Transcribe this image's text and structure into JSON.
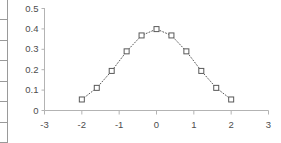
{
  "spreadsheet_strip": {
    "name": "cropped-spreadsheet-column",
    "visible_cell_count": 7,
    "cells": [
      "",
      "",
      "",
      "",
      "",
      "",
      ""
    ]
  },
  "chart_data": {
    "type": "scatter",
    "title": "",
    "subtitle": "",
    "xlabel": "",
    "ylabel": "",
    "xlim": [
      -3,
      3
    ],
    "ylim": [
      0,
      0.5
    ],
    "grid": false,
    "legend": false,
    "legend_position": "none",
    "marker": "square-open",
    "marker_color": "#595959",
    "line_style": "dotted",
    "line_color": "#595959",
    "axis_color": "#b3b3b3",
    "tick_label_color": "#4d4d4d",
    "series": [
      {
        "name": "Normal PDF",
        "x": [
          -2,
          -1.6,
          -1.2,
          -0.8,
          -0.4,
          0,
          0.4,
          0.8,
          1.2,
          1.6,
          2
        ],
        "values": [
          0.054,
          0.111,
          0.194,
          0.29,
          0.368,
          0.399,
          0.368,
          0.29,
          0.194,
          0.111,
          0.054
        ]
      }
    ],
    "x_ticks": [
      -3,
      -2,
      -1,
      0,
      1,
      2,
      3
    ],
    "x_tick_labels": [
      "-3",
      "-2",
      "-1",
      "0",
      "1",
      "2",
      "3"
    ],
    "y_ticks": [
      0,
      0.1,
      0.2,
      0.3,
      0.4,
      0.5
    ],
    "y_tick_labels": [
      "0",
      "0.1",
      "0.2",
      "0.3",
      "0.4",
      "0.5"
    ]
  }
}
